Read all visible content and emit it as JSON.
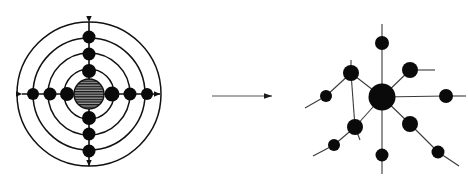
{
  "figure": {
    "background_color": "#ffffff",
    "width": 468,
    "height": 185,
    "node_color": "#0a0a0a",
    "edge_color": "#3a3a3a",
    "axis_color": "#111111",
    "arrow_color": "#555555"
  },
  "left_panel": {
    "name": "ordered-lattice-diagram",
    "caption": "",
    "center": {
      "x": 89,
      "y": 94
    },
    "core": {
      "label": "hatched-core",
      "radius": 15,
      "hatch": "horizontal-lines",
      "hatch_color": "#111111",
      "fill": "#8a8a8a"
    },
    "rings": [
      {
        "radius": 25
      },
      {
        "radius": 41
      },
      {
        "radius": 56
      },
      {
        "radius": 72
      }
    ],
    "axes": [
      {
        "label": "horizontal-axis",
        "x1": 16,
        "y1": 94,
        "x2": 166,
        "y2": 94,
        "arrow_start": true,
        "arrow_end": true
      },
      {
        "label": "vertical-axis",
        "x1": 89,
        "y1": 16,
        "x2": 89,
        "y2": 172,
        "arrow_start": true,
        "arrow_end": true
      }
    ],
    "nodes": [
      {
        "id": "L-e1",
        "x": 67,
        "y": 94,
        "r": 7.0
      },
      {
        "id": "L-e2",
        "x": 50,
        "y": 94,
        "r": 6.5
      },
      {
        "id": "L-e3",
        "x": 33,
        "y": 94,
        "r": 6.0
      },
      {
        "id": "L-w1",
        "x": 112,
        "y": 94,
        "r": 7.5
      },
      {
        "id": "L-w2",
        "x": 130,
        "y": 94,
        "r": 6.5
      },
      {
        "id": "L-w3",
        "x": 147,
        "y": 94,
        "r": 6.0
      },
      {
        "id": "L-n1",
        "x": 89,
        "y": 71,
        "r": 7.0
      },
      {
        "id": "L-n2",
        "x": 89,
        "y": 54,
        "r": 6.5
      },
      {
        "id": "L-n3",
        "x": 89,
        "y": 37,
        "r": 6.5
      },
      {
        "id": "L-s1",
        "x": 89,
        "y": 118,
        "r": 7.0
      },
      {
        "id": "L-s2",
        "x": 89,
        "y": 134,
        "r": 6.5
      },
      {
        "id": "L-s3",
        "x": 89,
        "y": 151,
        "r": 6.5
      }
    ]
  },
  "arrow": {
    "name": "transformation-arrow",
    "label": "",
    "x1": 212,
    "y1": 96,
    "x2": 278,
    "y2": 96,
    "direction": "right"
  },
  "right_panel": {
    "name": "disordered-network-diagram",
    "caption": "",
    "hub": {
      "id": "R-hub",
      "x": 382,
      "y": 97,
      "r": 13.5
    },
    "nodes": [
      {
        "id": "R-hub",
        "x": 382,
        "y": 97,
        "r": 13.5
      },
      {
        "id": "R-n1",
        "x": 351,
        "y": 73,
        "r": 8.0
      },
      {
        "id": "R-n2",
        "x": 326,
        "y": 96,
        "r": 6.0
      },
      {
        "id": "R-n3",
        "x": 355,
        "y": 127,
        "r": 8.0
      },
      {
        "id": "R-n4",
        "x": 334,
        "y": 145,
        "r": 6.0
      },
      {
        "id": "R-n5",
        "x": 382,
        "y": 43,
        "r": 7.0
      },
      {
        "id": "R-n6",
        "x": 410,
        "y": 70,
        "r": 8.0
      },
      {
        "id": "R-n7",
        "x": 446,
        "y": 96,
        "r": 7.0
      },
      {
        "id": "R-n8",
        "x": 410,
        "y": 124,
        "r": 8.0
      },
      {
        "id": "R-n9",
        "x": 438,
        "y": 152,
        "r": 6.5
      },
      {
        "id": "R-n10",
        "x": 382,
        "y": 155,
        "r": 6.5
      }
    ],
    "edges": [
      {
        "from": "R-hub",
        "to": "R-n1"
      },
      {
        "from": "R-hub",
        "to": "R-n3"
      },
      {
        "from": "R-n1",
        "to": "R-n2"
      },
      {
        "from": "R-n1",
        "to": "R-n3"
      },
      {
        "from": "R-n3",
        "to": "R-n4"
      },
      {
        "from": "R-hub",
        "to": "R-n5"
      },
      {
        "from": "R-hub",
        "to": "R-n6"
      },
      {
        "from": "R-hub",
        "to": "R-n7"
      },
      {
        "from": "R-hub",
        "to": "R-n8"
      },
      {
        "from": "R-n8",
        "to": "R-n9"
      },
      {
        "from": "R-hub",
        "to": "R-n10"
      }
    ],
    "stub_lines": [
      {
        "from": "R-n2",
        "x2": 305,
        "y2": 108
      },
      {
        "from": "R-n4",
        "x2": 313,
        "y2": 156
      },
      {
        "from": "R-n5",
        "x2": 382,
        "y2": 24
      },
      {
        "from": "R-n6",
        "x2": 435,
        "y2": 70
      },
      {
        "from": "R-n7",
        "x2": 466,
        "y2": 96
      },
      {
        "from": "R-n9",
        "x2": 459,
        "y2": 166
      },
      {
        "from": "R-n10",
        "x2": 382,
        "y2": 174
      },
      {
        "from": "R-n1",
        "x2": 351,
        "y2": 60
      },
      {
        "from": "R-n3",
        "x2": 360,
        "y2": 140
      }
    ]
  }
}
